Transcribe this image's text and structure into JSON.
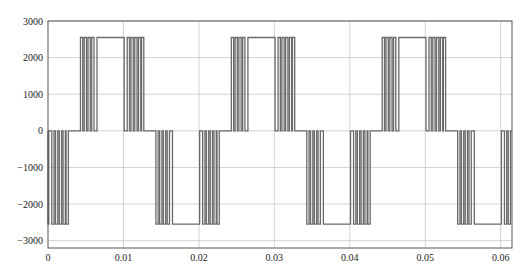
{
  "chart_data": {
    "type": "line",
    "title": "",
    "xlabel": "",
    "ylabel": "",
    "xlim": [
      0,
      0.0615
    ],
    "ylim": [
      -3200,
      3000
    ],
    "grid": true,
    "legend": null,
    "x_ticks": [
      0,
      0.01,
      0.02,
      0.03,
      0.04,
      0.05,
      0.06
    ],
    "x_tick_labels": [
      "0",
      "0.01",
      "0.02",
      "0.03",
      "0.04",
      "0.05",
      "0.06"
    ],
    "y_ticks": [
      3000,
      2000,
      1000,
      0,
      -1000,
      -2000,
      -3000
    ],
    "y_tick_labels": [
      "3000",
      "2000",
      "1000",
      "0",
      "-1000",
      "-2000",
      "-3000"
    ],
    "series": [
      {
        "name": "inverter output voltage",
        "color": "#6a6a6a",
        "description": "Multilevel PWM waveform, period 0.02 s, levels 0 and ±2550, PWM chopping near zero crossings",
        "period": 0.02,
        "amplitude": 2550,
        "phase_start": 0.0043,
        "pulse_edges_positive_half": [
          [
            0.0043,
            0.0046
          ],
          [
            0.0048,
            0.0051
          ],
          [
            0.0053,
            0.0056
          ],
          [
            0.0058,
            0.0061
          ],
          [
            0.0065,
            0.0101
          ],
          [
            0.0105,
            0.0108
          ],
          [
            0.011,
            0.0113
          ],
          [
            0.0115,
            0.0118
          ],
          [
            0.012,
            0.0123
          ],
          [
            0.0124,
            0.0127
          ]
        ]
      }
    ]
  },
  "plot": {
    "left": 48,
    "right": 512,
    "top": 21,
    "bottom": 248
  }
}
